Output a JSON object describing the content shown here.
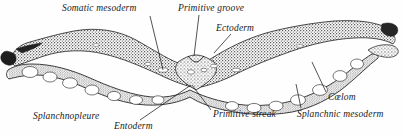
{
  "figure": {
    "background_color": "#fefefe",
    "ink_color": "#1a1a1a",
    "stipple_color": "#2b2b2b",
    "width": 405,
    "height": 136
  },
  "labels": {
    "somatic_mesoderm": "Somatic mesoderm",
    "primitive_groove": "Primitive groove",
    "ectoderm": "Ectoderm",
    "splanchnopleure": "Splanchnopleure",
    "entoderm": "Entoderm",
    "primitive_streak": "Primitive streak",
    "coelom": "Cœlom",
    "splanchnic_mesoderm": "Splanchnic mesoderm"
  },
  "leaders": [
    {
      "name": "somatic-mesoderm-leader",
      "x1": 150,
      "y1": 16,
      "x2": 163,
      "y2": 70
    },
    {
      "name": "primitive-groove-leader",
      "x1": 199,
      "y1": 15,
      "x2": 194,
      "y2": 56
    },
    {
      "name": "ectoderm-leader",
      "x1": 231,
      "y1": 34,
      "x2": 214,
      "y2": 53
    },
    {
      "name": "entoderm-leader",
      "x1": 191,
      "y1": 85,
      "x2": 140,
      "y2": 120
    },
    {
      "name": "primitive-streak-leader",
      "x1": 192,
      "y1": 85,
      "x2": 211,
      "y2": 110
    },
    {
      "name": "coelom-leader",
      "x1": 326,
      "y1": 92,
      "x2": 312,
      "y2": 62
    },
    {
      "name": "splanchnic-mesoderm-leader",
      "x1": 301,
      "y1": 108,
      "x2": 296,
      "y2": 84
    }
  ]
}
